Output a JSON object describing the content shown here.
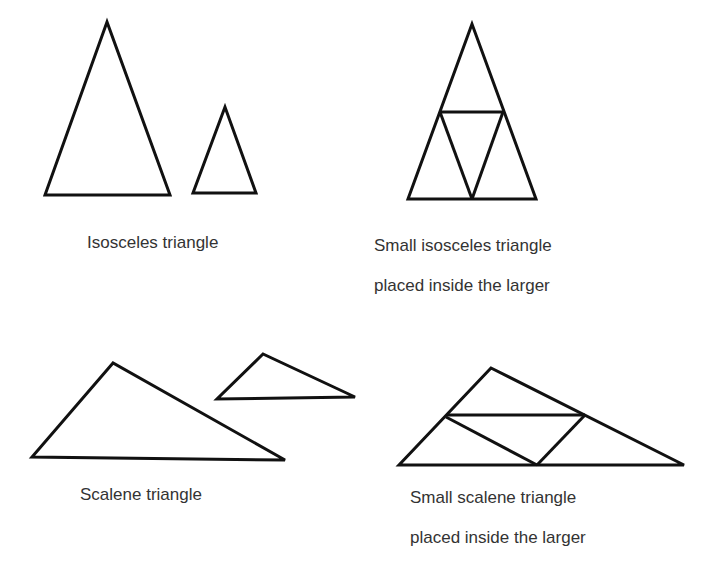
{
  "labels": {
    "isosceles": "Isosceles triangle",
    "isosceles_inside_line1": "Small isosceles triangle",
    "isosceles_inside_line2": "placed inside the larger",
    "scalene": "Scalene triangle",
    "scalene_inside_line1": "Small scalene triangle",
    "scalene_inside_line2": "placed inside the larger"
  },
  "stroke_color": "#111111",
  "text_color": "#333333"
}
